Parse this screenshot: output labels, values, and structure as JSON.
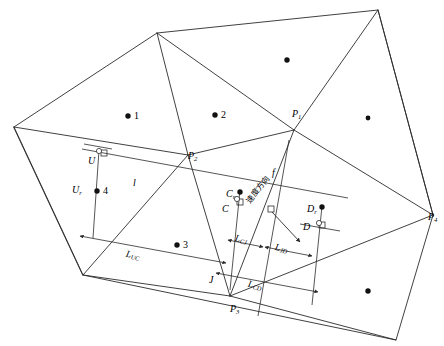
{
  "figure": {
    "type": "geometry-diagram",
    "stroke_color": "#2b2b2b",
    "background": "#ffffff",
    "width": 444,
    "height": 346
  },
  "vertex_labels": [
    {
      "id": "P1",
      "base": "P",
      "sub": "1",
      "x": 292,
      "y": 108
    },
    {
      "id": "P2",
      "base": "P",
      "sub": "2",
      "x": 188,
      "y": 150
    },
    {
      "id": "P3",
      "base": "P",
      "sub": "3",
      "x": 230,
      "y": 303
    },
    {
      "id": "P4",
      "base": "P",
      "sub": "4",
      "x": 428,
      "y": 211
    }
  ],
  "point_labels": [
    {
      "id": "U",
      "base": "U",
      "sub": "",
      "x": 88,
      "y": 155
    },
    {
      "id": "Ur",
      "base": "U",
      "sub": "r",
      "x": 72,
      "y": 184
    },
    {
      "id": "C",
      "base": "C",
      "sub": "",
      "x": 222,
      "y": 203
    },
    {
      "id": "Cr",
      "base": "C",
      "sub": "r",
      "x": 226,
      "y": 188
    },
    {
      "id": "D",
      "base": "D",
      "sub": "",
      "x": 303,
      "y": 221
    },
    {
      "id": "Dr",
      "base": "D",
      "sub": "r",
      "x": 307,
      "y": 203
    },
    {
      "id": "J",
      "base": "J",
      "sub": "",
      "x": 209,
      "y": 274
    },
    {
      "id": "f",
      "base": "f",
      "sub": "",
      "x": 272,
      "y": 167
    },
    {
      "id": "l",
      "base": "l",
      "sub": "",
      "x": 133,
      "y": 177
    }
  ],
  "cell_numbers": [
    {
      "id": "cell-1",
      "label": "1",
      "dot_x": 128,
      "dot_y": 116,
      "text_x": 134,
      "text_y": 110
    },
    {
      "id": "cell-2",
      "label": "2",
      "dot_x": 215,
      "dot_y": 115,
      "text_x": 221,
      "text_y": 109
    },
    {
      "id": "cell-3",
      "label": "3",
      "dot_x": 177,
      "dot_y": 245,
      "text_x": 183,
      "text_y": 239
    },
    {
      "id": "cell-4",
      "label": "4",
      "dot_x": 97,
      "dot_y": 191,
      "text_x": 103,
      "text_y": 185
    }
  ],
  "unlabeled_dots": [
    {
      "id": "dot-top-right",
      "x": 287,
      "y": 60
    },
    {
      "id": "dot-right",
      "x": 368,
      "y": 118
    },
    {
      "id": "dot-bottom-right",
      "x": 368,
      "y": 291
    }
  ],
  "dimension_labels": [
    {
      "id": "L_UC",
      "base": "L",
      "sub": "UC",
      "x": 126,
      "y": 250,
      "rotate": 12
    },
    {
      "id": "L_CJ",
      "base": "L",
      "sub": "CJ",
      "x": 235,
      "y": 234,
      "rotate": 12
    },
    {
      "id": "L_JD",
      "base": "L",
      "sub": "JD",
      "x": 275,
      "y": 243,
      "rotate": 12
    },
    {
      "id": "L_CD",
      "base": "L",
      "sub": "CD",
      "x": 248,
      "y": 280,
      "rotate": 12
    }
  ],
  "annotations": [
    {
      "id": "velocity-direction",
      "text": "速度方向",
      "x": 243,
      "y": 198,
      "rotate": -52
    }
  ],
  "marker_points": [
    {
      "id": "Ur-dot",
      "x": 97,
      "y": 191
    },
    {
      "id": "Cr-dot",
      "x": 240,
      "y": 192
    },
    {
      "id": "Dr-dot",
      "x": 322,
      "y": 207
    }
  ],
  "right_angle_markers": [
    {
      "id": "ra-U",
      "x": 104,
      "y": 155
    },
    {
      "id": "ra-C",
      "x": 241,
      "y": 205
    },
    {
      "id": "ra-J",
      "x": 272,
      "y": 211
    },
    {
      "id": "ra-D",
      "x": 322,
      "y": 228
    }
  ]
}
